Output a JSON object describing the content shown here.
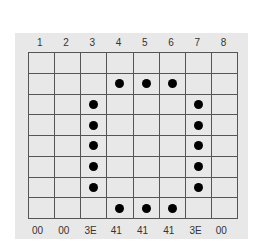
{
  "column_labels": [
    "1",
    "2",
    "3",
    "4",
    "5",
    "6",
    "7",
    "8"
  ],
  "hex_values": [
    "00",
    "00",
    "3E",
    "41",
    "41",
    "41",
    "3E",
    "00"
  ],
  "grid": {
    "rows": 8,
    "cols": 8,
    "filled": [
      [
        0,
        0,
        0,
        0,
        0,
        0,
        0,
        0
      ],
      [
        0,
        0,
        0,
        1,
        1,
        1,
        0,
        0
      ],
      [
        0,
        0,
        1,
        0,
        0,
        0,
        1,
        0
      ],
      [
        0,
        0,
        1,
        0,
        0,
        0,
        1,
        0
      ],
      [
        0,
        0,
        1,
        0,
        0,
        0,
        1,
        0
      ],
      [
        0,
        0,
        1,
        0,
        0,
        0,
        1,
        0
      ],
      [
        0,
        0,
        1,
        0,
        0,
        0,
        1,
        0
      ],
      [
        0,
        0,
        0,
        1,
        1,
        1,
        0,
        0
      ]
    ]
  },
  "colors": {
    "panel_bg": "#e8e8e8",
    "grid_line": "#555555",
    "dot": "#000000"
  }
}
